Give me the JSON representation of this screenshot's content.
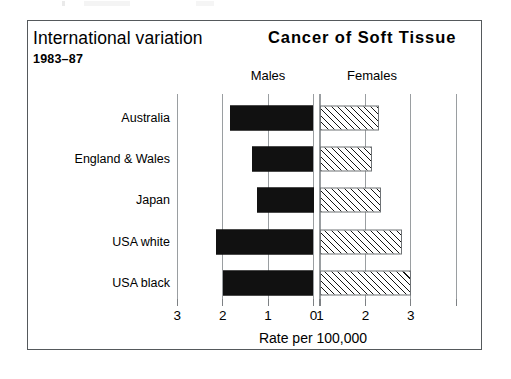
{
  "figure": {
    "title_main": "International variation",
    "title_sub": "1983–87",
    "title_right": "Cancer of Soft Tissue"
  },
  "panels": {
    "left_label": "Males",
    "right_label": "Females"
  },
  "axis": {
    "caption": "Rate per 100,000",
    "tick_labels": [
      "3",
      "2",
      "1",
      "0",
      "1",
      "2",
      "3"
    ]
  },
  "chart_data": {
    "type": "bar",
    "orientation": "horizontal",
    "layout": "population-pyramid",
    "title": "Cancer of Soft Tissue",
    "subtitle": "International variation 1983–87",
    "xlabel": "Rate per 100,000",
    "ylabel": "",
    "categories": [
      "Australia",
      "England & Wales",
      "Japan",
      "USA white",
      "USA black"
    ],
    "series": [
      {
        "name": "Males",
        "direction": "left",
        "fill": "solid-black",
        "values": [
          1.85,
          1.35,
          1.25,
          2.15,
          2.0
        ]
      },
      {
        "name": "Females",
        "direction": "right",
        "fill": "diagonal-hatch",
        "values": [
          1.3,
          1.15,
          1.35,
          1.8,
          2.0
        ]
      }
    ],
    "xlim_left": [
      0,
      3
    ],
    "xlim_right": [
      0,
      3
    ],
    "xticks_left": [
      3,
      2,
      1,
      0
    ],
    "xticks_right": [
      0,
      1,
      2,
      3
    ],
    "grid": true,
    "legend": "panel-headers"
  },
  "colors": {
    "male_bar": "#111111",
    "female_bar_outline": "#6e7275",
    "gridline": "#9a9ea1",
    "frame": "#55595c",
    "background": "#ffffff"
  }
}
